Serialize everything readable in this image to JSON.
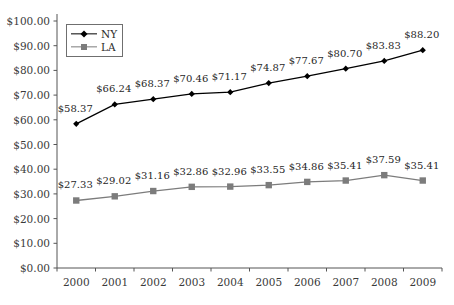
{
  "chart_data": {
    "type": "line",
    "title": "",
    "subtitle": "",
    "xlabel": "",
    "ylabel": "",
    "categories": [
      "2000",
      "2001",
      "2002",
      "2003",
      "2004",
      "2005",
      "2006",
      "2007",
      "2008",
      "2009"
    ],
    "ylim": [
      0,
      100
    ],
    "ytick_step": 10,
    "ytick_labels": [
      "$0.00",
      "$10.00",
      "$20.00",
      "$30.00",
      "$40.00",
      "$50.00",
      "$60.00",
      "$70.00",
      "$80.00",
      "$90.00",
      "$100.00"
    ],
    "ytick_values": [
      0,
      10,
      20,
      30,
      40,
      50,
      60,
      70,
      80,
      90,
      100
    ],
    "grid": false,
    "legend_position": "top-left-inside",
    "currency_prefix": "$",
    "series": [
      {
        "name": "NY",
        "color": "#000000",
        "marker": "diamond",
        "values": [
          58.37,
          66.24,
          68.37,
          70.46,
          71.17,
          74.87,
          77.67,
          80.7,
          83.83,
          88.2
        ],
        "labels": [
          "$58.37",
          "$66.24",
          "$68.37",
          "$70.46",
          "$71.17",
          "$74.87",
          "$77.67",
          "$80.70",
          "$83.83",
          "$88.20"
        ]
      },
      {
        "name": "LA",
        "color": "#7c7c7c",
        "marker": "square",
        "values": [
          27.33,
          29.02,
          31.16,
          32.86,
          32.96,
          33.55,
          34.86,
          35.41,
          37.59,
          35.41
        ],
        "labels": [
          "$27.33",
          "$29.02",
          "$31.16",
          "$32.86",
          "$32.96",
          "$33.55",
          "$34.86",
          "$35.41",
          "$37.59",
          "$35.41"
        ]
      }
    ]
  },
  "legend": {
    "entries": [
      {
        "label": "NY"
      },
      {
        "label": "LA"
      }
    ]
  },
  "colors": {
    "ny_series": "#000000",
    "la_series": "#7c7c7c",
    "axis": "#555555",
    "text": "#2b2b2b",
    "background": "#ffffff"
  }
}
